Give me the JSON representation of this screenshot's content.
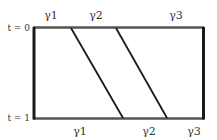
{
  "diagram": {
    "time_labels": {
      "top": "t = 0",
      "bottom": "t = 1"
    },
    "top_labels": [
      "γ1",
      "γ2",
      "γ3"
    ],
    "bottom_labels": [
      "γ1",
      "γ2",
      "γ3"
    ],
    "colors": {
      "line": "#1a1a1a",
      "edge": "#555555",
      "text": "#333333"
    }
  }
}
